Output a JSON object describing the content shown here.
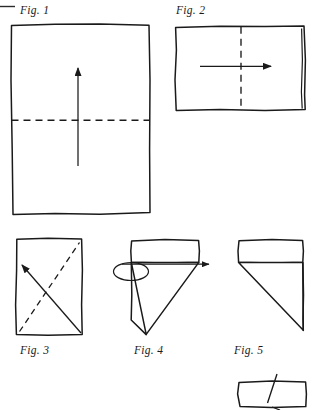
{
  "document": {
    "kind": "origami-folding-instructions",
    "page_background": "#ffffff",
    "ink_color": "#1a1a1a",
    "width": 313,
    "height": 410
  },
  "figures": [
    {
      "id": "fig1",
      "label": "Fig. 1",
      "label_x": 20,
      "label_y": 4,
      "shape": "portrait-rectangle",
      "rect": {
        "x": 11,
        "y": 24,
        "w": 139,
        "h": 190
      },
      "fold_line": {
        "type": "dashed-horizontal",
        "y": 120
      },
      "arrow": {
        "type": "straight-up",
        "from_x": 78,
        "from_y": 166,
        "to_x": 78,
        "to_y": 66
      },
      "description": "Square sheet with horizontal valley fold; arrow shows bottom edge folding up"
    },
    {
      "id": "fig2",
      "label": "Fig. 2",
      "label_x": 176,
      "label_y": 4,
      "shape": "landscape-rectangle",
      "rect": {
        "x": 175,
        "y": 26,
        "w": 131,
        "h": 84
      },
      "fold_line": {
        "type": "dashed-vertical",
        "x": 241
      },
      "doubled_edge": "right",
      "arrow": {
        "type": "straight-right",
        "from_x": 200,
        "from_y": 66,
        "to_x": 273,
        "to_y": 66
      },
      "description": "Folded rectangle with vertical valley fold; arrow shows left half folding to the right"
    },
    {
      "id": "fig3",
      "label": "Fig. 3",
      "label_x": 20,
      "label_y": 344,
      "shape": "portrait-rectangle",
      "rect": {
        "x": 16,
        "y": 238,
        "w": 66,
        "h": 97
      },
      "fold_line": {
        "type": "dashed-diagonal",
        "x1": 20,
        "y1": 331,
        "x2": 79,
        "y2": 243
      },
      "arrow": {
        "type": "straight-diagonal",
        "from_x": 80,
        "from_y": 332,
        "to_x": 21,
        "to_y": 264
      },
      "description": "Small rectangle with diagonal fold line and diagonal arrow toward upper-left"
    },
    {
      "id": "fig4",
      "label": "Fig. 4",
      "label_x": 134,
      "label_y": 344,
      "shape": "rectangle-with-left-triangle",
      "rect": {
        "x": 131,
        "y": 240,
        "w": 68,
        "h": 22
      },
      "triangle": {
        "p1x": 131,
        "p1y": 262,
        "p2x": 199,
        "p2y": 262,
        "p3x": 146,
        "p3y": 334
      },
      "loop_arrow": {
        "type": "flip-over-loop",
        "ellipse_cx": 131,
        "ellipse_cy": 271,
        "ellipse_rx": 17,
        "ellipse_ry": 9,
        "line_y": 264,
        "line_x2": 211
      },
      "description": "Rectangle with downward-left triangle; looping arrow indicates turning the model over"
    },
    {
      "id": "fig5",
      "label": "Fig. 5",
      "label_x": 234,
      "label_y": 344,
      "shape": "rectangle-with-right-triangle",
      "rect": {
        "x": 238,
        "y": 240,
        "w": 65,
        "h": 22
      },
      "triangle": {
        "p1x": 238,
        "p1y": 262,
        "p2x": 303,
        "p2y": 262,
        "p3x": 303,
        "p3y": 330
      },
      "description": "Mirrored result after turning over: rectangle with downward-right triangle"
    },
    {
      "id": "fig6-partial",
      "label": "",
      "shape": "partial-rectangle-cropped",
      "rect": {
        "x": 238,
        "y": 381,
        "w": 68,
        "h": 27
      },
      "fold_line": {
        "type": "solid-diagonal-short",
        "x1": 276,
        "y1": 377,
        "x2": 268,
        "y2": 402
      },
      "description": "Partially visible next step at bottom edge of page, cropped by page boundary"
    }
  ],
  "page_marks": [
    {
      "id": "top-left-rule",
      "x": 0,
      "y": 6,
      "w": 16,
      "h": 1,
      "description": "cropped horizontal rule at page corner"
    }
  ]
}
